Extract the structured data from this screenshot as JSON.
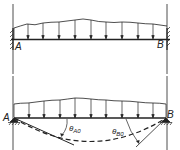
{
  "diagram": {
    "type": "beam-loading",
    "stroke_color": "#222222",
    "background": "#ffffff",
    "top_panel": {
      "description": "Fixed-end beam under distributed load",
      "support_left_label": "A",
      "support_right_label": "B",
      "support_type": "fixed",
      "load_arrow_count": 9
    },
    "bottom_panel": {
      "description": "Simply supported beam under distributed load with deflection curve",
      "support_left_label": "A",
      "support_right_label": "B",
      "support_type": "pinned",
      "load_arrow_count": 9,
      "angle_left": {
        "symbol": "θ",
        "subscript": "A0"
      },
      "angle_right": {
        "symbol": "θ",
        "subscript": "B0"
      }
    }
  }
}
